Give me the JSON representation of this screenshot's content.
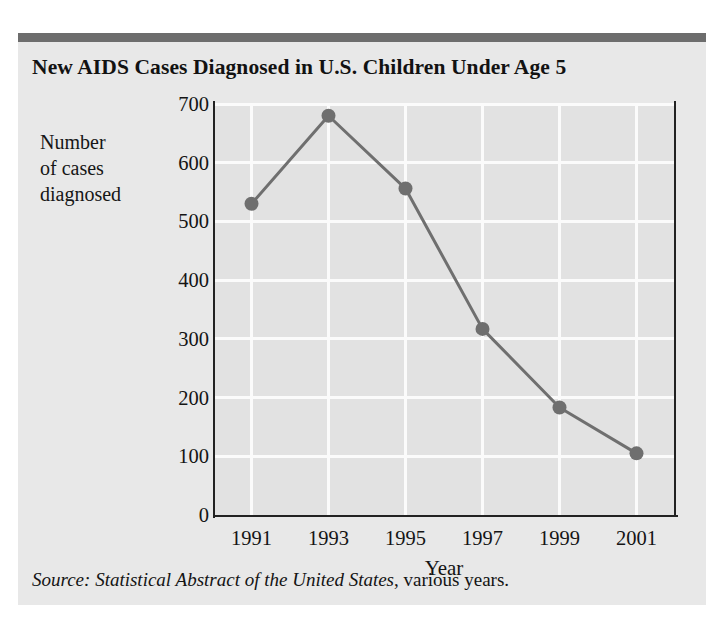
{
  "chart_data": {
    "type": "line",
    "title": "New AIDS Cases Diagnosed  in U.S. Children Under Age 5",
    "xlabel": "Year",
    "ylabel": "Number of cases diagnosed",
    "ylabel_lines": [
      "Number",
      "of cases",
      "diagnosed"
    ],
    "categories": [
      "1991",
      "1993",
      "1995",
      "1997",
      "1999",
      "2001"
    ],
    "x": [
      1991,
      1993,
      1995,
      1997,
      1999,
      2001
    ],
    "values": [
      530,
      680,
      556,
      317,
      183,
      105
    ],
    "series": [
      {
        "name": "New AIDS cases diagnosed",
        "values": [
          530,
          680,
          556,
          317,
          183,
          105
        ]
      }
    ],
    "ylim": [
      0,
      700
    ],
    "yticks": [
      "0",
      "100",
      "200",
      "300",
      "400",
      "500",
      "600",
      "700"
    ],
    "ytick_values": [
      0,
      100,
      200,
      300,
      400,
      500,
      600,
      700
    ],
    "xticks": [
      "1991",
      "1993",
      "1995",
      "1997",
      "1999",
      "2001"
    ],
    "xlim": [
      1990,
      2002
    ],
    "grid": "both-white-on-gray",
    "legend": "none",
    "marker": "filled-circle",
    "line_color": "#6f6f6f",
    "marker_color": "#6f6f6f",
    "plot_background": "#e2e2e2",
    "gridline_color": "#fbfbfb",
    "axis_color": "#222222"
  },
  "figure": {
    "panel_background": "#e8e8e8",
    "top_rule_color": "#6d6d6d",
    "source_prefix": "Source: Statistical Abstract of the United States",
    "source_suffix": ", various years."
  }
}
